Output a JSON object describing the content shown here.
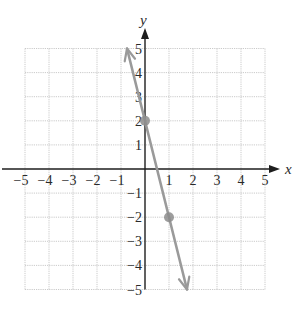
{
  "chart_data": {
    "type": "line",
    "title": "",
    "xlabel": "x",
    "ylabel": "y",
    "xlim": [
      -5,
      5
    ],
    "ylim": [
      -5,
      5
    ],
    "grid": true,
    "x_ticks": [
      -5,
      -4,
      -3,
      -2,
      -1,
      1,
      2,
      3,
      4,
      5
    ],
    "y_ticks": [
      -5,
      -4,
      -3,
      -2,
      -1,
      1,
      2,
      3,
      4,
      5
    ],
    "x_tick_labels": [
      "−5",
      "−4",
      "−3",
      "−2",
      "−1",
      "1",
      "2",
      "3",
      "4",
      "5"
    ],
    "y_tick_labels": [
      "−5",
      "−4",
      "−3",
      "−2",
      "−1",
      "1",
      "2",
      "3",
      "4",
      "5"
    ],
    "series": [
      {
        "name": "line",
        "equation": "y = -4x + 2",
        "slope": -4,
        "intercept": 2,
        "x": [
          -0.75,
          1.75
        ],
        "y": [
          5,
          -5
        ],
        "arrows_both_ends": true,
        "color": "#9a9a9a"
      }
    ],
    "points": [
      {
        "x": 0,
        "y": 2,
        "color": "#8c8c8c"
      },
      {
        "x": 1,
        "y": -2,
        "color": "#8c8c8c"
      }
    ]
  },
  "labels": {
    "x_axis": "x",
    "y_axis": "y"
  },
  "colors": {
    "axis": "#1e1e1e",
    "grid": "#bdbdbd",
    "line": "#9a9a9a",
    "point": "#8c8c8c"
  }
}
